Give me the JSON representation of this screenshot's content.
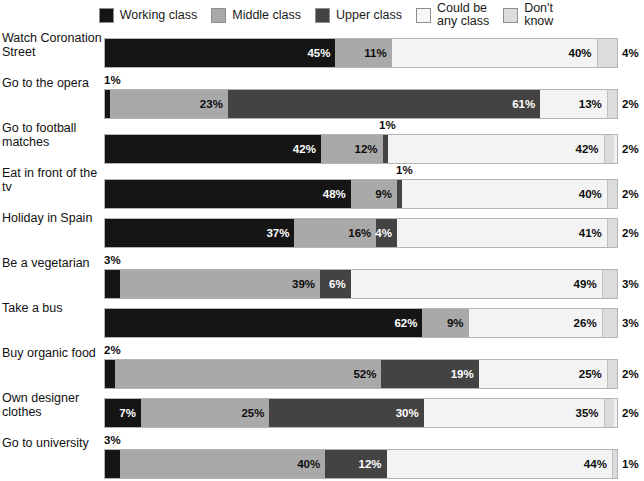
{
  "chart_data": {
    "type": "bar",
    "subtype": "stacked-horizontal-100percent",
    "title": "",
    "subtitle": "",
    "xlabel": "",
    "ylabel": "",
    "xlim": [
      0,
      100
    ],
    "grid": false,
    "legend_position": "top",
    "units": "%",
    "categories": [
      "Watch Coronation Street",
      "Go to the opera",
      "Go to football matches",
      "Eat in front of the tv",
      "Holiday in Spain",
      "Be a vegetarian",
      "Take a bus",
      "Buy organic food",
      "Own designer clothes",
      "Go to university"
    ],
    "series": [
      {
        "name": "Working class",
        "color": "#151515",
        "values": [
          45,
          1,
          42,
          48,
          37,
          3,
          62,
          2,
          7,
          3
        ]
      },
      {
        "name": "Middle class",
        "color": "#a9a9a9",
        "values": [
          11,
          23,
          12,
          9,
          16,
          39,
          9,
          52,
          25,
          40
        ]
      },
      {
        "name": "Upper class",
        "color": "#434343",
        "values": [
          0,
          61,
          1,
          1,
          4,
          6,
          0,
          19,
          30,
          12
        ]
      },
      {
        "name": "Could be any class",
        "color": "#f3f3f3",
        "values": [
          40,
          13,
          42,
          40,
          41,
          49,
          26,
          25,
          35,
          44
        ]
      },
      {
        "name": "Don't know",
        "color": "#dcdcdc",
        "values": [
          4,
          2,
          2,
          2,
          2,
          3,
          3,
          2,
          2,
          1
        ]
      }
    ]
  },
  "legend": {
    "items": [
      {
        "label": "Working class",
        "color": "#151515"
      },
      {
        "label": "Middle class",
        "color": "#a9a9a9"
      },
      {
        "label": "Upper class",
        "color": "#434343"
      },
      {
        "label": "Could be\nany class",
        "color": "#f6f6f6"
      },
      {
        "label": "Don't\nknow",
        "color": "#dcdcdc"
      }
    ]
  },
  "rows": [
    {
      "label": "Watch Coronation Street",
      "segments": [
        {
          "key": "working",
          "value": 45,
          "text": "45%",
          "placement": "inside"
        },
        {
          "key": "middle",
          "value": 11,
          "text": "11%",
          "placement": "inside"
        },
        {
          "key": "upper",
          "value": 0,
          "text": "",
          "placement": "none"
        },
        {
          "key": "anyclass",
          "value": 40,
          "text": "40%",
          "placement": "inside"
        },
        {
          "key": "dontknow",
          "value": 4,
          "text": "4%",
          "placement": "outside-right"
        }
      ],
      "above_label": {
        "text": "",
        "show": false
      }
    },
    {
      "label": "Go to the opera",
      "segments": [
        {
          "key": "working",
          "value": 1,
          "text": "1%",
          "placement": "above"
        },
        {
          "key": "middle",
          "value": 23,
          "text": "23%",
          "placement": "inside"
        },
        {
          "key": "upper",
          "value": 61,
          "text": "61%",
          "placement": "inside"
        },
        {
          "key": "anyclass",
          "value": 13,
          "text": "13%",
          "placement": "inside"
        },
        {
          "key": "dontknow",
          "value": 2,
          "text": "2%",
          "placement": "outside-right"
        }
      ],
      "above_label": {
        "text": "1%",
        "show": true,
        "left": 104
      }
    },
    {
      "label": "Go to football matches",
      "segments": [
        {
          "key": "working",
          "value": 42,
          "text": "42%",
          "placement": "inside"
        },
        {
          "key": "middle",
          "value": 12,
          "text": "12%",
          "placement": "inside"
        },
        {
          "key": "upper",
          "value": 1,
          "text": "1%",
          "placement": "above"
        },
        {
          "key": "anyclass",
          "value": 42,
          "text": "42%",
          "placement": "inside"
        },
        {
          "key": "dontknow",
          "value": 2,
          "text": "2%",
          "placement": "outside-right"
        }
      ],
      "above_label": {
        "text": "1%",
        "show": true,
        "left": 379
      }
    },
    {
      "label": "Eat in front of the tv",
      "segments": [
        {
          "key": "working",
          "value": 48,
          "text": "48%",
          "placement": "inside"
        },
        {
          "key": "middle",
          "value": 9,
          "text": "9%",
          "placement": "inside"
        },
        {
          "key": "upper",
          "value": 1,
          "text": "1%",
          "placement": "above"
        },
        {
          "key": "anyclass",
          "value": 40,
          "text": "40%",
          "placement": "inside"
        },
        {
          "key": "dontknow",
          "value": 2,
          "text": "2%",
          "placement": "outside-right"
        }
      ],
      "above_label": {
        "text": "1%",
        "show": true,
        "left": 396
      }
    },
    {
      "label": "Holiday in Spain",
      "segments": [
        {
          "key": "working",
          "value": 37,
          "text": "37%",
          "placement": "inside"
        },
        {
          "key": "middle",
          "value": 16,
          "text": "16%",
          "placement": "inside"
        },
        {
          "key": "upper",
          "value": 4,
          "text": "4%",
          "placement": "inside"
        },
        {
          "key": "anyclass",
          "value": 41,
          "text": "41%",
          "placement": "inside"
        },
        {
          "key": "dontknow",
          "value": 2,
          "text": "2%",
          "placement": "outside-right"
        }
      ],
      "above_label": {
        "text": "",
        "show": false
      }
    },
    {
      "label": "Be a vegetarian",
      "segments": [
        {
          "key": "working",
          "value": 3,
          "text": "3%",
          "placement": "above"
        },
        {
          "key": "middle",
          "value": 39,
          "text": "39%",
          "placement": "inside"
        },
        {
          "key": "upper",
          "value": 6,
          "text": "6%",
          "placement": "inside"
        },
        {
          "key": "anyclass",
          "value": 49,
          "text": "49%",
          "placement": "inside"
        },
        {
          "key": "dontknow",
          "value": 3,
          "text": "3%",
          "placement": "outside-right"
        }
      ],
      "above_label": {
        "text": "3%",
        "show": true,
        "left": 104
      }
    },
    {
      "label": "Take a bus",
      "segments": [
        {
          "key": "working",
          "value": 62,
          "text": "62%",
          "placement": "inside"
        },
        {
          "key": "middle",
          "value": 9,
          "text": "9%",
          "placement": "inside"
        },
        {
          "key": "upper",
          "value": 0,
          "text": "",
          "placement": "none"
        },
        {
          "key": "anyclass",
          "value": 26,
          "text": "26%",
          "placement": "inside"
        },
        {
          "key": "dontknow",
          "value": 3,
          "text": "3%",
          "placement": "outside-right"
        }
      ],
      "above_label": {
        "text": "",
        "show": false
      }
    },
    {
      "label": "Buy organic food",
      "segments": [
        {
          "key": "working",
          "value": 2,
          "text": "2%",
          "placement": "above"
        },
        {
          "key": "middle",
          "value": 52,
          "text": "52%",
          "placement": "inside"
        },
        {
          "key": "upper",
          "value": 19,
          "text": "19%",
          "placement": "inside"
        },
        {
          "key": "anyclass",
          "value": 25,
          "text": "25%",
          "placement": "inside"
        },
        {
          "key": "dontknow",
          "value": 2,
          "text": "2%",
          "placement": "outside-right"
        }
      ],
      "above_label": {
        "text": "2%",
        "show": true,
        "left": 104
      }
    },
    {
      "label": "Own designer clothes",
      "segments": [
        {
          "key": "working",
          "value": 7,
          "text": "7%",
          "placement": "inside"
        },
        {
          "key": "middle",
          "value": 25,
          "text": "25%",
          "placement": "inside"
        },
        {
          "key": "upper",
          "value": 30,
          "text": "30%",
          "placement": "inside"
        },
        {
          "key": "anyclass",
          "value": 35,
          "text": "35%",
          "placement": "inside"
        },
        {
          "key": "dontknow",
          "value": 2,
          "text": "2%",
          "placement": "outside-right"
        }
      ],
      "above_label": {
        "text": "",
        "show": false
      }
    },
    {
      "label": "Go to university",
      "segments": [
        {
          "key": "working",
          "value": 3,
          "text": "3%",
          "placement": "above"
        },
        {
          "key": "middle",
          "value": 40,
          "text": "40%",
          "placement": "inside"
        },
        {
          "key": "upper",
          "value": 12,
          "text": "12%",
          "placement": "inside"
        },
        {
          "key": "anyclass",
          "value": 44,
          "text": "44%",
          "placement": "inside"
        },
        {
          "key": "dontknow",
          "value": 1,
          "text": "1%",
          "placement": "outside-right"
        }
      ],
      "above_label": {
        "text": "3%",
        "show": true,
        "left": 104
      }
    }
  ],
  "footer": {
    "note": ""
  }
}
